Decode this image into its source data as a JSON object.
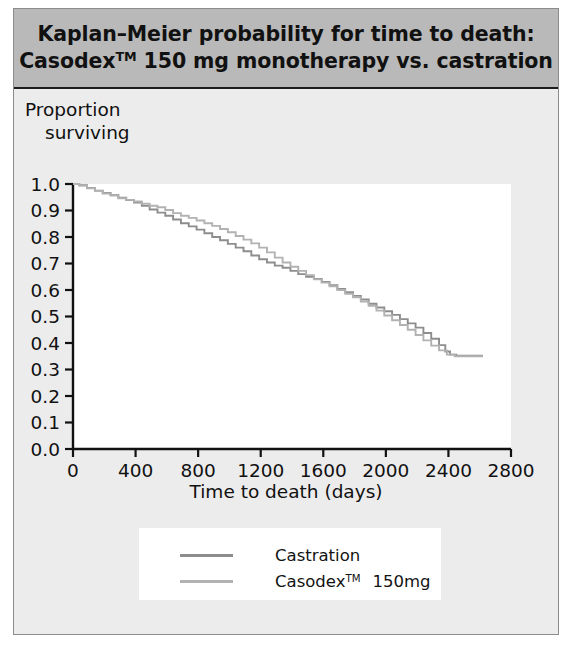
{
  "figure": {
    "title_line_1": "Kaplan–Meier probability for time to death:",
    "title_line_2_pre": "Casodex",
    "title_line_2_tm": "TM",
    "title_line_2_post": " 150 mg monotherapy vs. castration",
    "background_color": "#ececec",
    "title_band_color": "#b9b9b9"
  },
  "chart_data": {
    "type": "line",
    "xlabel": "Time to death (days)",
    "ylabel_line_1": "Proportion",
    "ylabel_line_2": "surviving",
    "ylabel": "Proportion surviving",
    "xlim": [
      0,
      2800
    ],
    "ylim": [
      0,
      1.0
    ],
    "xticks": [
      0,
      400,
      800,
      1200,
      1600,
      2000,
      2400,
      2800
    ],
    "xtick_labels": [
      "0",
      "400",
      "800",
      "1200",
      "1600",
      "2000",
      "2400",
      "2800"
    ],
    "yticks": [
      0.0,
      0.1,
      0.2,
      0.3,
      0.4,
      0.5,
      0.6,
      0.7,
      0.8,
      0.9,
      1.0
    ],
    "ytick_labels": [
      "0.0",
      "0.1",
      "0.2",
      "0.3",
      "0.4",
      "0.5",
      "0.6",
      "0.7",
      "0.8",
      "0.9",
      "1.0"
    ],
    "grid": false,
    "legend_position": "below-plot",
    "step_style": "post",
    "series": [
      {
        "name": "Castration",
        "label": "Castration",
        "color": "#8d8d8d",
        "points": [
          [
            0,
            1.0
          ],
          [
            40,
            0.995
          ],
          [
            90,
            0.985
          ],
          [
            140,
            0.975
          ],
          [
            190,
            0.966
          ],
          [
            240,
            0.958
          ],
          [
            290,
            0.948
          ],
          [
            340,
            0.939
          ],
          [
            390,
            0.93
          ],
          [
            440,
            0.918
          ],
          [
            490,
            0.904
          ],
          [
            540,
            0.892
          ],
          [
            590,
            0.88
          ],
          [
            640,
            0.866
          ],
          [
            690,
            0.852
          ],
          [
            740,
            0.84
          ],
          [
            790,
            0.828
          ],
          [
            840,
            0.814
          ],
          [
            890,
            0.8
          ],
          [
            940,
            0.788
          ],
          [
            990,
            0.774
          ],
          [
            1040,
            0.76
          ],
          [
            1090,
            0.746
          ],
          [
            1140,
            0.73
          ],
          [
            1190,
            0.716
          ],
          [
            1240,
            0.704
          ],
          [
            1290,
            0.692
          ],
          [
            1340,
            0.684
          ],
          [
            1390,
            0.672
          ],
          [
            1440,
            0.66
          ],
          [
            1490,
            0.65
          ],
          [
            1540,
            0.642
          ],
          [
            1590,
            0.63
          ],
          [
            1640,
            0.618
          ],
          [
            1690,
            0.604
          ],
          [
            1740,
            0.592
          ],
          [
            1790,
            0.578
          ],
          [
            1840,
            0.564
          ],
          [
            1890,
            0.548
          ],
          [
            1940,
            0.534
          ],
          [
            1990,
            0.52
          ],
          [
            2040,
            0.506
          ],
          [
            2090,
            0.49
          ],
          [
            2140,
            0.474
          ],
          [
            2190,
            0.458
          ],
          [
            2240,
            0.438
          ],
          [
            2290,
            0.416
          ],
          [
            2340,
            0.392
          ],
          [
            2380,
            0.368
          ],
          [
            2410,
            0.356
          ],
          [
            2450,
            0.352
          ],
          [
            2620,
            0.352
          ]
        ]
      },
      {
        "name": "Casodex 150mg",
        "label_pre": "Casodex",
        "label_tm": "TM",
        "label_dose": "150mg",
        "label": "Casodex™ 150mg",
        "color": "#b2b2b2",
        "points": [
          [
            0,
            1.0
          ],
          [
            40,
            0.994
          ],
          [
            90,
            0.984
          ],
          [
            140,
            0.974
          ],
          [
            190,
            0.964
          ],
          [
            240,
            0.956
          ],
          [
            290,
            0.946
          ],
          [
            340,
            0.94
          ],
          [
            390,
            0.934
          ],
          [
            440,
            0.926
          ],
          [
            490,
            0.918
          ],
          [
            540,
            0.912
          ],
          [
            590,
            0.902
          ],
          [
            640,
            0.89
          ],
          [
            690,
            0.88
          ],
          [
            740,
            0.872
          ],
          [
            790,
            0.862
          ],
          [
            840,
            0.852
          ],
          [
            890,
            0.842
          ],
          [
            940,
            0.83
          ],
          [
            990,
            0.818
          ],
          [
            1040,
            0.804
          ],
          [
            1090,
            0.79
          ],
          [
            1140,
            0.776
          ],
          [
            1190,
            0.76
          ],
          [
            1240,
            0.742
          ],
          [
            1290,
            0.722
          ],
          [
            1340,
            0.704
          ],
          [
            1390,
            0.688
          ],
          [
            1440,
            0.672
          ],
          [
            1490,
            0.656
          ],
          [
            1540,
            0.64
          ],
          [
            1590,
            0.628
          ],
          [
            1640,
            0.614
          ],
          [
            1690,
            0.6
          ],
          [
            1740,
            0.586
          ],
          [
            1790,
            0.572
          ],
          [
            1840,
            0.556
          ],
          [
            1890,
            0.54
          ],
          [
            1940,
            0.522
          ],
          [
            1990,
            0.504
          ],
          [
            2040,
            0.486
          ],
          [
            2090,
            0.468
          ],
          [
            2140,
            0.45
          ],
          [
            2190,
            0.43
          ],
          [
            2240,
            0.41
          ],
          [
            2290,
            0.39
          ],
          [
            2340,
            0.372
          ],
          [
            2390,
            0.356
          ],
          [
            2440,
            0.35
          ],
          [
            2620,
            0.35
          ]
        ]
      }
    ]
  }
}
